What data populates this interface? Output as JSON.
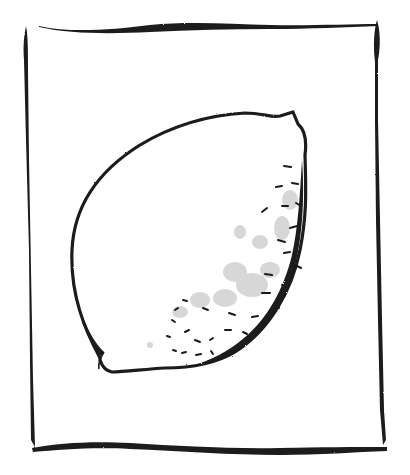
{
  "image": {
    "description": "Hand-drawn ink sketch of a lemon inside a rough rectangular frame",
    "subject": "lemon",
    "style": "brush ink sketch",
    "colors": {
      "background": "#ffffff",
      "ink": "#1a1a1a",
      "stipple": "#9a9a9a"
    }
  }
}
